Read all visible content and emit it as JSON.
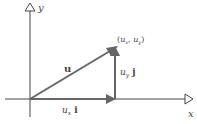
{
  "diagram": {
    "axes": {
      "x_label": "x",
      "y_label": "y"
    },
    "vectors": {
      "u": {
        "label": "u"
      },
      "ux_i": {
        "label_var": "u",
        "label_sub": "x",
        "label_unit": "i"
      },
      "uy_j": {
        "label_var": "u",
        "label_sub": "y",
        "label_unit": "j"
      }
    },
    "point": {
      "label_open": "(",
      "x_var": "u",
      "x_sub": "x",
      "sep": ", ",
      "y_var": "u",
      "y_sub": "y",
      "label_close": ")"
    },
    "colors": {
      "axis": "#444444",
      "vector": "#666666",
      "text": "#444444"
    }
  }
}
